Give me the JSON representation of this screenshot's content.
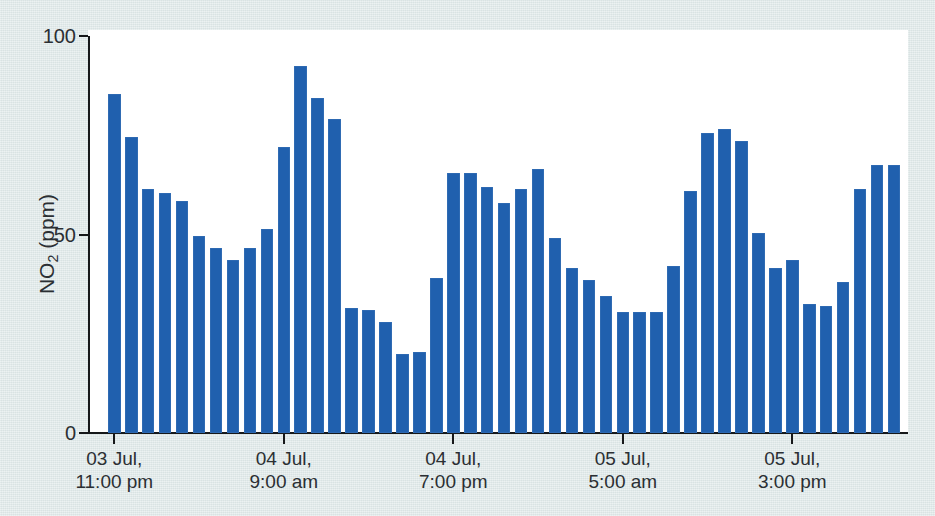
{
  "figure": {
    "background_color": "#dde7e7",
    "plot_background_color": "#ffffff",
    "bar_color": "#2060ae",
    "axis_color": "#16181a"
  },
  "axes": {
    "y_title_main": "NO",
    "y_title_sub": "2",
    "y_title_unit": " (ppm)",
    "y_title_full": "NO2 (ppm)",
    "y_ticks": [
      "0",
      "50",
      "100"
    ],
    "x_ticks": [
      {
        "line1": "03 Jul,",
        "line2": "11:00 pm"
      },
      {
        "line1": "04 Jul,",
        "line2": "9:00 am"
      },
      {
        "line1": "04 Jul,",
        "line2": "7:00 pm"
      },
      {
        "line1": "05 Jul,",
        "line2": "5:00 am"
      },
      {
        "line1": "05 Jul,",
        "line2": "3:00 pm"
      }
    ]
  },
  "chart_data": {
    "type": "bar",
    "title": "",
    "xlabel": "",
    "ylabel": "NO2 (ppm)",
    "ylim": [
      0,
      100
    ],
    "yticks": [
      0,
      50,
      100
    ],
    "grid": false,
    "legend": "none",
    "bar_color": "#2060ae",
    "x_tick_labels": [
      "03 Jul, 11:00 pm",
      "04 Jul, 9:00 am",
      "04 Jul, 7:00 pm",
      "05 Jul, 5:00 am",
      "05 Jul, 3:00 pm"
    ],
    "x_tick_bar_indices": [
      0,
      10,
      20,
      30,
      40
    ],
    "categories": [
      "03 Jul, 11:00 pm",
      "04 Jul, 12:00 am",
      "04 Jul, 1:00 am",
      "04 Jul, 2:00 am",
      "04 Jul, 3:00 am",
      "04 Jul, 4:00 am",
      "04 Jul, 5:00 am",
      "04 Jul, 6:00 am",
      "04 Jul, 7:00 am",
      "04 Jul, 8:00 am",
      "04 Jul, 9:00 am",
      "04 Jul, 10:00 am",
      "04 Jul, 11:00 am",
      "04 Jul, 12:00 pm",
      "04 Jul, 1:00 pm",
      "04 Jul, 2:00 pm",
      "04 Jul, 3:00 pm",
      "04 Jul, 4:00 pm",
      "04 Jul, 5:00 pm",
      "04 Jul, 6:00 pm",
      "04 Jul, 7:00 pm",
      "04 Jul, 8:00 pm",
      "04 Jul, 9:00 pm",
      "04 Jul, 10:00 pm",
      "04 Jul, 11:00 pm",
      "05 Jul, 12:00 am",
      "05 Jul, 1:00 am",
      "05 Jul, 2:00 am",
      "05 Jul, 3:00 am",
      "05 Jul, 4:00 am",
      "05 Jul, 5:00 am",
      "05 Jul, 6:00 am",
      "05 Jul, 7:00 am",
      "05 Jul, 8:00 am",
      "05 Jul, 9:00 am",
      "05 Jul, 10:00 am",
      "05 Jul, 11:00 am",
      "05 Jul, 12:00 pm",
      "05 Jul, 1:00 pm",
      "05 Jul, 2:00 pm",
      "05 Jul, 3:00 pm",
      "05 Jul, 4:00 pm",
      "05 Jul, 5:00 pm",
      "05 Jul, 6:00 pm",
      "05 Jul, 7:00 pm",
      "05 Jul, 8:00 pm",
      "05 Jul, 9:00 pm"
    ],
    "values": [
      85.5,
      74.5,
      61.5,
      60.5,
      58.5,
      49.5,
      46.5,
      43.5,
      46.5,
      51.5,
      72.0,
      92.5,
      84.5,
      79.0,
      31.5,
      31.0,
      28.0,
      20.0,
      20.5,
      39.0,
      65.5,
      65.5,
      62.0,
      58.0,
      61.5,
      66.5,
      49.0,
      41.5,
      38.5,
      34.5,
      30.5,
      30.5,
      30.5,
      42.0,
      61.0,
      75.5,
      76.5,
      73.5,
      50.5,
      41.5,
      43.5,
      32.5,
      32.0,
      38.0,
      61.5,
      67.5,
      67.5
    ]
  }
}
